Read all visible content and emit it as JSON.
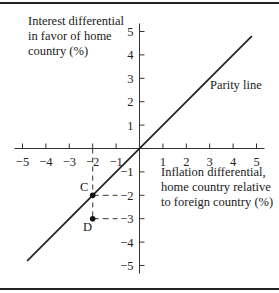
{
  "chart_data": {
    "type": "line",
    "title": "",
    "ylabel": "Interest differential in favor of home country (%)",
    "ylabel_lines": [
      "Interest differential",
      "in favor of home",
      "country (%)"
    ],
    "xlabel": "Inflation differential, home country relative to foreign country (%)",
    "xlabel_lines": [
      "Inflation differential,",
      "home country relative",
      "to foreign country (%)"
    ],
    "xlim": [
      -5,
      5
    ],
    "ylim": [
      -5,
      5
    ],
    "x_ticks": [
      -5,
      -4,
      -3,
      -2,
      -1,
      1,
      2,
      3,
      4,
      5
    ],
    "y_ticks": [
      5,
      4,
      3,
      2,
      1,
      -1,
      -2,
      -3,
      -4,
      -5
    ],
    "x_tick_labels": [
      "−5",
      "−4",
      "−3",
      "−2",
      "−1",
      "1",
      "2",
      "3",
      "4",
      "5"
    ],
    "y_tick_labels": [
      "5",
      "4",
      "3",
      "2",
      "1",
      "−1",
      "−2",
      "−3",
      "−4",
      "−5"
    ],
    "grid": false,
    "series": [
      {
        "name": "Parity line",
        "x": [
          -4.8,
          4.8
        ],
        "y": [
          -4.8,
          4.8
        ]
      }
    ],
    "points": [
      {
        "label": "C",
        "x": -2,
        "y": -2
      },
      {
        "label": "D",
        "x": -2,
        "y": -3
      }
    ],
    "annotations": [
      {
        "text": "Parity line"
      },
      {
        "text": "C"
      },
      {
        "text": "D"
      }
    ]
  }
}
